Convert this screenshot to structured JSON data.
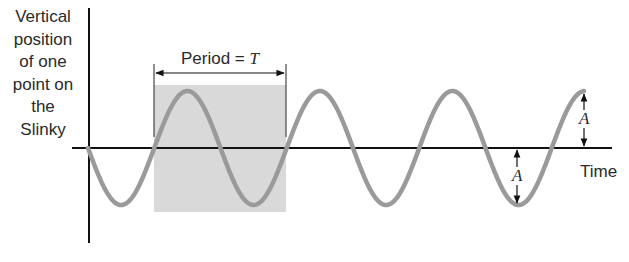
{
  "diagram": {
    "y_axis_label_lines": [
      "Vertical",
      "position",
      "of one",
      "point on",
      "the",
      "Slinky"
    ],
    "x_axis_label": "Time",
    "period_label_text": "Period = ",
    "period_symbol": "T",
    "amplitude_symbol": "A",
    "colors": {
      "wave": "#9a9a9a",
      "axis": "#111111",
      "shaded_region": "#d9d9d9",
      "text": "#2a2a2a"
    }
  },
  "chart_data": {
    "type": "line",
    "title": "",
    "xlabel": "Time",
    "ylabel": "Vertical position of one point on the Slinky",
    "function": "y = -A sin(2*pi*t/T)",
    "periods_shown": 3.75,
    "annotations": [
      {
        "type": "bracket",
        "label": "Period = T",
        "spans": "one full period (shaded)"
      },
      {
        "type": "arrow",
        "label": "A",
        "meaning": "amplitude, trough to axis"
      },
      {
        "type": "arrow",
        "label": "A",
        "meaning": "amplitude, axis to crest"
      }
    ],
    "grid": false
  }
}
